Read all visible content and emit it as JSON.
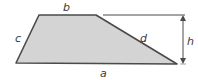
{
  "diagram": {
    "shape": "trapezoid",
    "colors": {
      "fill": "#d4d4d4",
      "stroke": "#4a4a4a",
      "label": "#3a3a3a",
      "background": "#ffffff"
    },
    "vertices": {
      "top_left": [
        39,
        15
      ],
      "top_right": [
        96,
        15
      ],
      "bottom_right": [
        177,
        64
      ],
      "bottom_left": [
        16,
        63
      ]
    },
    "labels": {
      "top_side": "b",
      "bottom_side": "a",
      "left_side": "c",
      "right_side": "d",
      "height": "h"
    },
    "height_dimension": {
      "extension_line_from": [
        103,
        15
      ],
      "extension_line_to": [
        185,
        15
      ],
      "arrow_x": 183,
      "arrow_top_y": 17,
      "arrow_bottom_y": 63
    }
  }
}
